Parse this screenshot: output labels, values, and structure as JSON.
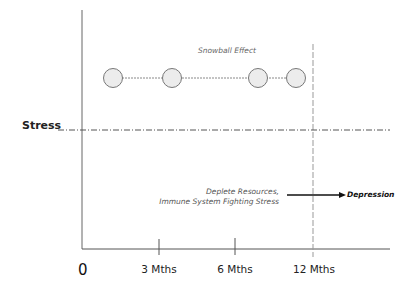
{
  "diagram": {
    "y_label": "Stress",
    "origin_label": "0",
    "x_ticks": [
      {
        "label": "3 Mths",
        "x": 159
      },
      {
        "label": "6 Mths",
        "x": 235
      },
      {
        "label": "12 Mths",
        "x": 314
      }
    ],
    "snowball": {
      "label": "Snowball Effect",
      "circles_x": [
        113,
        172,
        258,
        296
      ],
      "circles_y": 78
    },
    "annotation": {
      "line1": "Deplete Resources,",
      "line2": "Immune System Fighting Stress",
      "outcome": "Depression"
    },
    "colors": {
      "axis": "#555555",
      "circle_fill": "#ececec",
      "circle_stroke": "#777777",
      "arrow": "#111111"
    }
  }
}
